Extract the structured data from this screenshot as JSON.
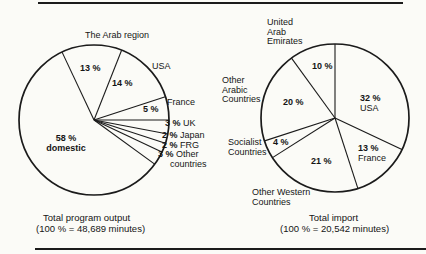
{
  "chart_data": [
    {
      "type": "pie",
      "title": "Total program output",
      "subtitle": "(100 % = 48,689 minutes)",
      "total_label": "100 %",
      "total_minutes": 48689,
      "direction": "clockwise",
      "start_angle_deg": 115.2,
      "slices": [
        {
          "label": "The Arab region",
          "pct_label": "13 %",
          "value": 13
        },
        {
          "label": "USA",
          "pct_label": "14 %",
          "value": 14
        },
        {
          "label": "France",
          "pct_label": "5 %",
          "value": 5
        },
        {
          "label": "UK",
          "pct_label": "3 %",
          "value": 3
        },
        {
          "label": "Japan",
          "pct_label": "2 %",
          "value": 2
        },
        {
          "label": "FRG",
          "pct_label": "2 %",
          "value": 2
        },
        {
          "label": "Other countries",
          "pct_label": "3 %",
          "value": 3
        },
        {
          "label": "domestic",
          "pct_label": "58 %",
          "value": 58
        }
      ]
    },
    {
      "type": "pie",
      "title": "Total import",
      "subtitle": "(100 % = 20,542 minutes)",
      "total_label": "100 %",
      "total_minutes": 20542,
      "direction": "clockwise",
      "start_angle_deg": 90,
      "slices": [
        {
          "label": "USA",
          "pct_label": "32 %",
          "value": 32
        },
        {
          "label": "France",
          "pct_label": "13 %",
          "value": 13
        },
        {
          "label": "Other Western Countries",
          "pct_label": "21 %",
          "value": 21
        },
        {
          "label": "Socialist Countries",
          "pct_label": "4 %",
          "value": 4
        },
        {
          "label": "Other Arabic Countries",
          "pct_label": "20 %",
          "value": 20
        },
        {
          "label": "United Arab Emirates",
          "pct_label": "10 %",
          "value": 10
        }
      ]
    }
  ],
  "colors": {
    "ink": "#1b1b1b",
    "paper": "#fbfbf7"
  }
}
